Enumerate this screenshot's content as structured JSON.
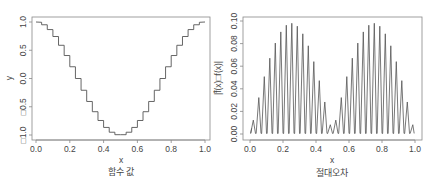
{
  "chart_data": [
    {
      "type": "line",
      "title": "함수 값",
      "xlabel": "x",
      "ylabel": "y",
      "xlim": [
        0.0,
        1.0
      ],
      "ylim": [
        -1.0,
        1.0
      ],
      "x_ticks": [
        "0.0",
        "0.2",
        "0.4",
        "0.6",
        "0.8",
        "1.0"
      ],
      "y_ticks": [
        "□1.0",
        "□0.5",
        "0.0",
        "0.5",
        "1.0"
      ],
      "y_tick_values": [
        -1.0,
        -0.5,
        0.0,
        0.5,
        1.0
      ],
      "x_tick_values": [
        0.0,
        0.2,
        0.4,
        0.6,
        0.8,
        1.0
      ],
      "grid": false,
      "description": "Staircase (piecewise-constant) approximation of y = cos(2*pi*x)",
      "function": "cos(2*pi*x)",
      "steps": 30,
      "series": [
        {
          "name": "step approximation",
          "x": [
            0.0,
            0.1,
            0.2,
            0.3,
            0.4,
            0.5,
            0.6,
            0.7,
            0.8,
            0.9,
            1.0
          ],
          "values": [
            1.0,
            0.81,
            0.31,
            -0.31,
            -0.81,
            -1.0,
            -0.81,
            -0.31,
            0.31,
            0.81,
            1.0
          ]
        }
      ],
      "line_color": "#555555"
    },
    {
      "type": "line",
      "title": "절대오차",
      "xlabel": "x",
      "ylabel": "|f̂(x)□f(x)|",
      "xlim": [
        0.0,
        1.0
      ],
      "ylim": [
        0.0,
        0.1
      ],
      "x_ticks": [
        "0.0",
        "0.2",
        "0.4",
        "0.6",
        "0.8",
        "1.0"
      ],
      "y_ticks": [
        "0.00",
        "0.02",
        "0.04",
        "0.06",
        "0.08",
        "0.10"
      ],
      "y_tick_values": [
        0.0,
        0.02,
        0.04,
        0.06,
        0.08,
        0.1
      ],
      "x_tick_values": [
        0.0,
        0.2,
        0.4,
        0.6,
        0.8,
        1.0
      ],
      "grid": false,
      "description": "Sawtooth absolute error of the step approximation; peak envelope ~0.1*|sin(2*pi*x)|, max near x=0.25 and x=0.75 (~0.098), near zero at x=0, 0.5, 1",
      "teeth": 30,
      "peak": 0.098,
      "series": [
        {
          "name": "absolute error envelope",
          "x": [
            0.0,
            0.05,
            0.1,
            0.15,
            0.2,
            0.25,
            0.3,
            0.35,
            0.4,
            0.45,
            0.5,
            0.55,
            0.6,
            0.65,
            0.7,
            0.75,
            0.8,
            0.85,
            0.9,
            0.95,
            1.0
          ],
          "values": [
            0.005,
            0.03,
            0.058,
            0.08,
            0.094,
            0.098,
            0.094,
            0.08,
            0.058,
            0.03,
            0.005,
            0.03,
            0.058,
            0.08,
            0.094,
            0.098,
            0.094,
            0.08,
            0.058,
            0.03,
            0.005
          ]
        }
      ],
      "line_color": "#555555"
    }
  ],
  "panels": {
    "left": {
      "title": "함수 값",
      "xlabel": "x",
      "ylabel": "y"
    },
    "right": {
      "title": "절대오차",
      "xlabel": "x",
      "ylabel": "|f̂(x)□f(x)|"
    }
  }
}
